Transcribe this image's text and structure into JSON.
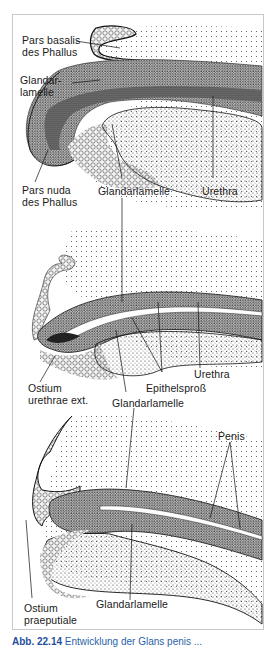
{
  "figure": {
    "panels": [
      {
        "id": "stage-1",
        "labels": {
          "pars_basalis": "Pars basalis\ndes Phallus",
          "pars_basalis_l1": "Pars basalis",
          "pars_basalis_l2": "des Phallus",
          "glandarlamelle_top_l1": "Glandar-",
          "glandarlamelle_top_l2": "lamelle",
          "pars_nuda_l1": "Pars nuda",
          "pars_nuda_l2": "des Phallus",
          "glandarlamelle": "Glandarlamelle",
          "urethra": "Urethra"
        }
      },
      {
        "id": "stage-2",
        "labels": {
          "ostium_l1": "Ostium",
          "ostium_l2": "urethrae ext.",
          "epithelspross": "Epithelsproß",
          "urethra": "Urethra",
          "glandarlamelle": "Glandarlamelle"
        }
      },
      {
        "id": "stage-3",
        "labels": {
          "penis": "Penis",
          "ostium_l1": "Ostium",
          "ostium_l2": "praeputiale",
          "glandarlamelle": "Glandarlamelle"
        }
      }
    ],
    "caption": {
      "number": "Abb. 22.14",
      "text": "Entwicklung der Glans penis ..."
    }
  },
  "colors": {
    "ink": "#1a1a1a",
    "frame": "#c8c8c8",
    "caption": "#2a5fa8"
  }
}
